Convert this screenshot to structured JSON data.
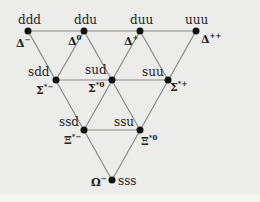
{
  "diagram": {
    "type": "baryon-decuplet",
    "colors": {
      "line": "#8a8a8a",
      "dot": "#111111",
      "background": "#ececea"
    },
    "nodes": [
      {
        "id": "ddd",
        "quarks": "ddd",
        "particle": "Δ",
        "charge": "−",
        "x": 28,
        "y": 31
      },
      {
        "id": "ddu",
        "quarks": "ddu",
        "particle": "Δ",
        "charge": "0",
        "x": 84,
        "y": 31
      },
      {
        "id": "duu",
        "quarks": "duu",
        "particle": "Δ",
        "charge": "+",
        "x": 140,
        "y": 31
      },
      {
        "id": "uuu",
        "quarks": "uuu",
        "particle": "Δ",
        "charge": "++",
        "x": 196,
        "y": 31
      },
      {
        "id": "sdd",
        "quarks": "sdd",
        "particle": "Σ",
        "charge": "*−",
        "x": 56,
        "y": 80
      },
      {
        "id": "sud",
        "quarks": "sud",
        "particle": "Σ",
        "charge": "*0",
        "x": 112,
        "y": 80
      },
      {
        "id": "suu",
        "quarks": "suu",
        "particle": "Σ",
        "charge": "*+",
        "x": 168,
        "y": 80
      },
      {
        "id": "ssd",
        "quarks": "ssd",
        "particle": "Ξ",
        "charge": "*−",
        "x": 84,
        "y": 130
      },
      {
        "id": "ssu",
        "quarks": "ssu",
        "particle": "Ξ",
        "charge": "*0",
        "x": 140,
        "y": 130
      },
      {
        "id": "sss",
        "quarks": "sss",
        "particle": "Ω",
        "charge": "−",
        "x": 112,
        "y": 180
      }
    ]
  }
}
